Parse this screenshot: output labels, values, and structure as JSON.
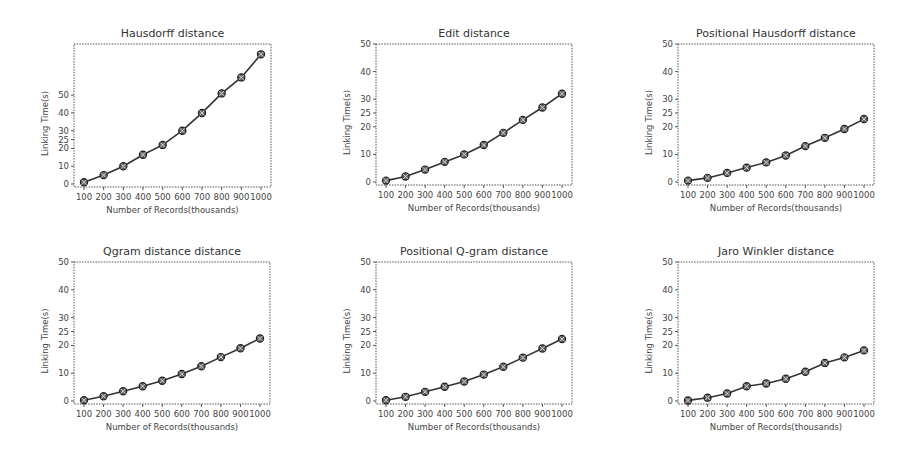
{
  "figure": {
    "layout": "2x3 grid of line charts",
    "shared_xlabel": "Number of Records(thousands)",
    "shared_ylabel": "Linking Time(s)"
  },
  "chart_data": [
    {
      "type": "line",
      "title": "Hausdorff distance",
      "xlabel": "Number of Records(thousands)",
      "ylabel": "Linking Time(s)",
      "categories": [
        "100",
        "200",
        "300",
        "400",
        "500",
        "600",
        "700",
        "800",
        "900",
        "1000"
      ],
      "x": [
        100,
        200,
        300,
        400,
        500,
        600,
        700,
        800,
        900,
        1000
      ],
      "values": [
        1,
        5,
        10,
        16.5,
        22,
        30,
        40,
        51,
        60,
        73
      ],
      "yticks": [
        0,
        10,
        20,
        25,
        30,
        40,
        50
      ],
      "ylim": [
        0,
        76
      ],
      "grid": false,
      "legend": null
    },
    {
      "type": "line",
      "title": "Edit distance",
      "xlabel": "Number of Records(thousands)",
      "ylabel": "Linking Time(s)",
      "categories": [
        "100",
        "200",
        "300",
        "400",
        "500",
        "600",
        "700",
        "800",
        "900",
        "1000"
      ],
      "x": [
        100,
        200,
        300,
        400,
        500,
        600,
        700,
        800,
        900,
        1000
      ],
      "values": [
        0.5,
        2,
        4.5,
        7.3,
        10,
        13.4,
        17.8,
        22.5,
        27,
        32
      ],
      "yticks": [
        0,
        10,
        20,
        25,
        30,
        40,
        50
      ],
      "ylim": [
        0,
        50
      ],
      "grid": false,
      "legend": null
    },
    {
      "type": "line",
      "title": "Positional Hausdorff distance",
      "xlabel": "Number of Records(thousands)",
      "ylabel": "Linking Time(s)",
      "categories": [
        "100",
        "200",
        "300",
        "400",
        "500",
        "600",
        "700",
        "800",
        "900",
        "1000"
      ],
      "x": [
        100,
        200,
        300,
        400,
        500,
        600,
        700,
        800,
        900,
        1000
      ],
      "values": [
        0.5,
        1.5,
        3.3,
        5.2,
        7.1,
        9.6,
        13,
        16,
        19.2,
        22.8
      ],
      "yticks": [
        0,
        10,
        20,
        25,
        30,
        40,
        50
      ],
      "ylim": [
        0,
        50
      ],
      "grid": false,
      "legend": null
    },
    {
      "type": "line",
      "title": "Qgram distance distance",
      "xlabel": "Number of Records(thousands)",
      "ylabel": "Linking Time(s)",
      "categories": [
        "100",
        "200",
        "300",
        "400",
        "500",
        "600",
        "700",
        "800",
        "900",
        "1000"
      ],
      "x": [
        100,
        200,
        300,
        400,
        500,
        600,
        700,
        800,
        900,
        1000
      ],
      "values": [
        0.3,
        1.7,
        3.5,
        5.3,
        7.3,
        9.7,
        12.5,
        15.8,
        19,
        22.5
      ],
      "yticks": [
        0,
        10,
        20,
        25,
        30,
        40,
        50
      ],
      "ylim": [
        0,
        50
      ],
      "grid": false,
      "legend": null
    },
    {
      "type": "line",
      "title": "Positional Q-gram distance",
      "xlabel": "Number of Records(thousands)",
      "ylabel": "Linking Time(s)",
      "categories": [
        "100",
        "200",
        "300",
        "400",
        "500",
        "600",
        "700",
        "800",
        "900",
        "1000"
      ],
      "x": [
        100,
        200,
        300,
        400,
        500,
        600,
        700,
        800,
        900,
        1000
      ],
      "values": [
        0.3,
        1.5,
        3.3,
        5.1,
        7,
        9.5,
        12.3,
        15.6,
        18.9,
        22.3
      ],
      "yticks": [
        0,
        10,
        20,
        25,
        30,
        40,
        50
      ],
      "ylim": [
        0,
        50
      ],
      "grid": false,
      "legend": null
    },
    {
      "type": "line",
      "title": "Jaro Winkler distance",
      "xlabel": "Number of Records(thousands)",
      "ylabel": "Linking Time(s)",
      "categories": [
        "100",
        "200",
        "300",
        "400",
        "500",
        "600",
        "700",
        "800",
        "900",
        "1000"
      ],
      "x": [
        100,
        200,
        300,
        400,
        500,
        600,
        700,
        800,
        900,
        1000
      ],
      "values": [
        0.2,
        1.2,
        2.7,
        5.3,
        6.3,
        8,
        10.5,
        13.7,
        15.7,
        18.2
      ],
      "yticks": [
        0,
        10,
        20,
        25,
        30,
        40,
        50
      ],
      "ylim": [
        0,
        50
      ],
      "grid": false,
      "legend": null
    }
  ],
  "colors": {
    "line": "#333333",
    "marker_fill": "#666666",
    "frame": "#555555",
    "text": "#333333"
  }
}
